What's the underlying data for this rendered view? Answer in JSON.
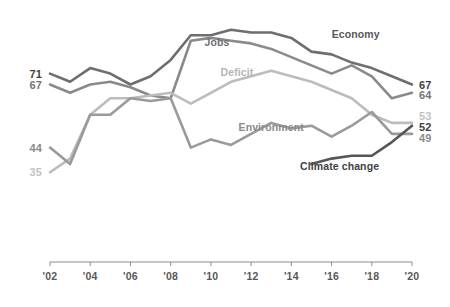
{
  "chart_data": {
    "type": "line",
    "title": "",
    "subtitle": "",
    "xlabel": "",
    "ylabel": "",
    "grid": false,
    "legend_position": "inline-labels",
    "x": [
      2002,
      2003,
      2004,
      2005,
      2006,
      2007,
      2008,
      2009,
      2010,
      2011,
      2012,
      2013,
      2014,
      2015,
      2016,
      2017,
      2018,
      2019,
      2020
    ],
    "tick_labels": [
      "'02",
      "'04",
      "'06",
      "'08",
      "'10",
      "'12",
      "'14",
      "'16",
      "'18",
      "'20"
    ],
    "tick_years": [
      2002,
      2004,
      2006,
      2008,
      2010,
      2012,
      2014,
      2016,
      2018,
      2020
    ],
    "ylim": [
      30,
      92
    ],
    "series": [
      {
        "name": "Economy",
        "color": "#6e6e70",
        "label_color": "#58585a",
        "label_x": 2017.2,
        "label_y": 84,
        "start_label": "71",
        "end_label": "67",
        "start_label_color": "#3f3f41",
        "end_label_color": "#3f3f41",
        "values": [
          71,
          68,
          73,
          71,
          67,
          70,
          76,
          85,
          85,
          87,
          86,
          86,
          84,
          79,
          78,
          75,
          73,
          70,
          67
        ]
      },
      {
        "name": "Jobs",
        "color": "#8a8a8c",
        "label_color": "#6e6e70",
        "label_x": 2010.3,
        "label_y": 81,
        "start_label": "67",
        "end_label": "64",
        "start_label_color": "#75757a",
        "end_label_color": "#75757a",
        "values": [
          67,
          64,
          67,
          68,
          66,
          63,
          62,
          83,
          84,
          83,
          82,
          80,
          77,
          74,
          71,
          74,
          70,
          62,
          64
        ]
      },
      {
        "name": "Deficit",
        "color": "#bcbcbe",
        "label_color": "#b4b4b6",
        "label_x": 2011.3,
        "label_y": 70,
        "start_label": "35",
        "end_label": "53",
        "start_label_color": "#c2c2c4",
        "end_label_color": "#c2c2c4",
        "values": [
          35,
          40,
          56,
          62,
          62,
          63,
          64,
          60,
          64,
          68,
          70,
          72,
          70,
          68,
          65,
          62,
          56,
          53,
          53
        ]
      },
      {
        "name": "Environment",
        "color": "#9a9a9c",
        "label_color": "#8a8a8c",
        "label_x": 2013.0,
        "label_y": 50,
        "start_label": "44",
        "end_label": "49",
        "start_label_color": "#8a8a8c",
        "end_label_color": "#8a8a8c",
        "values": [
          44,
          38,
          56,
          56,
          62,
          61,
          62,
          44,
          47,
          45,
          49,
          53,
          51,
          52,
          48,
          52,
          57,
          49,
          49
        ]
      },
      {
        "name": "Climate change",
        "color": "#56565a",
        "label_color": "#3f3f41",
        "label_x": 2016.4,
        "label_y": 36,
        "start_label": "",
        "end_label": "52",
        "start_label_color": "#3f3f41",
        "end_label_color": "#3f3f41",
        "start_year": 2015,
        "values": [
          null,
          null,
          null,
          null,
          null,
          null,
          null,
          null,
          null,
          null,
          null,
          null,
          null,
          38,
          40,
          41,
          41,
          46,
          52
        ]
      }
    ],
    "left_labels": [
      {
        "text": "71",
        "color": "#3f3f41",
        "bold": true,
        "y": 71
      },
      {
        "text": "67",
        "color": "#75757a",
        "bold": true,
        "y": 67
      },
      {
        "text": "44",
        "color": "#8a8a8c",
        "bold": true,
        "y": 44
      },
      {
        "text": "35",
        "color": "#c2c2c4",
        "bold": true,
        "y": 35
      }
    ],
    "right_labels": [
      {
        "text": "67",
        "color": "#3f3f41",
        "bold": true,
        "y": 67
      },
      {
        "text": "64",
        "color": "#75757a",
        "bold": true,
        "y": 63.2
      },
      {
        "text": "53",
        "color": "#c2c2c4",
        "bold": true,
        "y": 55.5
      },
      {
        "text": "52",
        "color": "#3f3f41",
        "bold": true,
        "y": 51.5
      },
      {
        "text": "49",
        "color": "#8a8a8c",
        "bold": true,
        "y": 47.5
      }
    ]
  }
}
